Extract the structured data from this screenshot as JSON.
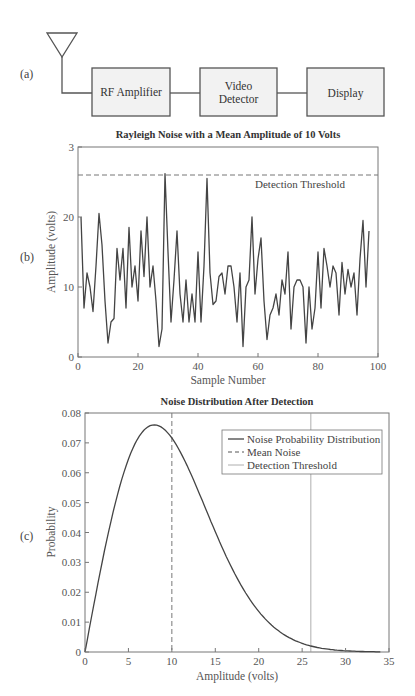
{
  "panels": {
    "a": "(a)",
    "b": "(b)",
    "c": "(c)"
  },
  "block_diagram": {
    "blocks": [
      {
        "id": "rf-amplifier",
        "lines": [
          "RF Amplifier"
        ]
      },
      {
        "id": "video-detector",
        "lines": [
          "Video",
          "Detector"
        ]
      },
      {
        "id": "display",
        "lines": [
          "Display"
        ]
      }
    ],
    "icon": "antenna-icon"
  },
  "chart_data": [
    {
      "type": "line",
      "title": "Rayleigh Noise with a Mean Amplitude of 10 Volts",
      "xlabel": "Sample Number",
      "ylabel": "Amplitude (volts)",
      "xlim": [
        0,
        100
      ],
      "ylim": [
        0,
        30
      ],
      "xticks": [
        "0",
        "20",
        "40",
        "60",
        "80",
        "100"
      ],
      "yticks": [
        "0",
        "10",
        "20",
        "3"
      ],
      "grid": false,
      "annotations": [
        {
          "text": "Detection Threshold",
          "type": "dashed-hline",
          "y": 26
        }
      ],
      "series": [
        {
          "name": "Rayleigh noise",
          "x_start": 1,
          "values": [
            20,
            7,
            12,
            10,
            6.5,
            13,
            20.5,
            16,
            8,
            2,
            5,
            5.5,
            15.5,
            11,
            15.5,
            7,
            18.5,
            10,
            13,
            8,
            18,
            11.5,
            20,
            10,
            13,
            8,
            1.5,
            4,
            26.2,
            15,
            5,
            11,
            18,
            9,
            5,
            11,
            5,
            9,
            5,
            15,
            5,
            13,
            25.5,
            12,
            7.5,
            8,
            11.5,
            12,
            9,
            13,
            13,
            10,
            5,
            12,
            1.5,
            10,
            11,
            20,
            9,
            14,
            17,
            8,
            2.5,
            6,
            7,
            9,
            6,
            11,
            9,
            15,
            4,
            10,
            11,
            11,
            10,
            2,
            10,
            4,
            7,
            15,
            7,
            15.5,
            13,
            10,
            13,
            12,
            6,
            13.5,
            9,
            12.5,
            10,
            12,
            6,
            14,
            19.5,
            10,
            18
          ]
        }
      ]
    },
    {
      "type": "line",
      "title": "Noise Distribution After Detection",
      "xlabel": "Amplitude (volts)",
      "ylabel": "Probability",
      "xlim": [
        0,
        35
      ],
      "ylim": [
        0,
        0.08
      ],
      "xticks": [
        "0",
        "5",
        "10",
        "15",
        "20",
        "25",
        "30",
        "35"
      ],
      "yticks": [
        "0",
        "0.01",
        "0.02",
        "0.03",
        "0.04",
        "0.05",
        "0.06",
        "0.07",
        "0.08"
      ],
      "grid": false,
      "legend_position": "upper right",
      "series": [
        {
          "name": "Noise Probability Distribution",
          "style": "solid",
          "x": [
            0,
            2,
            4,
            6,
            8,
            10,
            12,
            14,
            16,
            18,
            20,
            22,
            24,
            26,
            28,
            30,
            32,
            34
          ],
          "values": [
            0,
            0.03,
            0.055,
            0.07,
            0.076,
            0.072,
            0.062,
            0.05,
            0.036,
            0.025,
            0.015,
            0.0094,
            0.0051,
            0.0027,
            0.0013,
            0.0006,
            0.0002,
            0.0001
          ]
        },
        {
          "name": "Mean Noise",
          "style": "dashed",
          "vline_x": 10
        },
        {
          "name": "Detection Threshold",
          "style": "solid-thin",
          "vline_x": 26
        }
      ]
    }
  ],
  "legend": {
    "items": [
      "Noise Probability Distribution",
      "Mean Noise",
      "Detection Threshold"
    ]
  },
  "colors": {
    "line": "#444444",
    "axis": "#777777",
    "threshold": "#9a9a9a",
    "box_fill": "#f2f2f2"
  }
}
